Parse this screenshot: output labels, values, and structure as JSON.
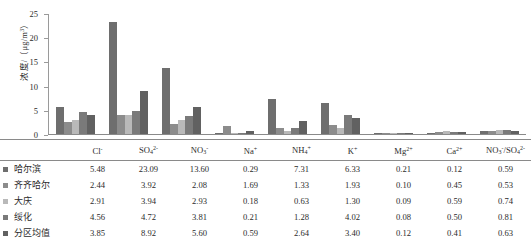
{
  "chart_data": {
    "type": "bar",
    "title": "",
    "xlabel": "",
    "ylabel": "浓度/（μg/m³）",
    "ylim": [
      0,
      25
    ],
    "yticks": [
      0,
      5,
      10,
      15,
      20,
      25
    ],
    "grid": false,
    "legend_position": "table-left",
    "categories": [
      "Cl⁻",
      "SO₄²⁻",
      "NO₃⁻",
      "Na⁺",
      "NH₄⁺",
      "K⁺",
      "Mg²⁺",
      "Ca²⁺",
      "NO₃⁻/SO₄²⁻"
    ],
    "categories_html": [
      "Cl<sup>-</sup>",
      "SO<sub>4</sub><sup>2-</sup>",
      "NO<sub>3</sub><sup>-</sup>",
      "Na<sup>+</sup>",
      "NH<sub>4</sub><sup>+</sup>",
      "K<sup>+</sup>",
      "Mg<sup>2+</sup>",
      "Ca<sup>2+</sup>",
      "NO<sub>3</sub><sup>-</sup>/SO<sub>4</sub><sup>2-</sup>"
    ],
    "series": [
      {
        "name": "哈尔滨",
        "color": "#6e6e6e",
        "values": [
          5.48,
          23.09,
          13.6,
          0.29,
          7.31,
          6.33,
          0.21,
          0.12,
          0.59
        ]
      },
      {
        "name": "齐齐哈尔",
        "color": "#8c8c8c",
        "values": [
          2.44,
          3.92,
          2.08,
          1.69,
          1.33,
          1.93,
          0.1,
          0.45,
          0.53
        ]
      },
      {
        "name": "大庆",
        "color": "#b9b9b9",
        "values": [
          2.91,
          3.94,
          2.93,
          0.18,
          0.63,
          1.3,
          0.09,
          0.59,
          0.74
        ]
      },
      {
        "name": "绥化",
        "color": "#7a7a7a",
        "values": [
          4.56,
          4.72,
          3.81,
          0.21,
          1.28,
          4.02,
          0.08,
          0.5,
          0.81
        ]
      },
      {
        "name": "分区均值",
        "color": "#616161",
        "values": [
          3.85,
          8.92,
          5.6,
          0.59,
          2.64,
          3.4,
          0.12,
          0.41,
          0.63
        ]
      }
    ]
  },
  "table": {
    "corner_label": "",
    "headers": [
      "Cl⁻",
      "SO₄²⁻",
      "NO₃⁻",
      "Na⁺",
      "NH₄⁺",
      "K⁺",
      "Mg²⁺",
      "Ca²⁺",
      "NO₃⁻/SO₄²⁻"
    ],
    "rows": [
      {
        "label": "哈尔滨",
        "values": [
          "5.48",
          "23.09",
          "13.60",
          "0.29",
          "7.31",
          "6.33",
          "0.21",
          "0.12",
          "0.59"
        ]
      },
      {
        "label": "齐齐哈尔",
        "values": [
          "2.44",
          "3.92",
          "2.08",
          "1.69",
          "1.33",
          "1.93",
          "0.10",
          "0.45",
          "0.53"
        ]
      },
      {
        "label": "大庆",
        "values": [
          "2.91",
          "3.94",
          "2.93",
          "0.18",
          "0.63",
          "1.30",
          "0.09",
          "0.59",
          "0.74"
        ]
      },
      {
        "label": "绥化",
        "values": [
          "4.56",
          "4.72",
          "3.81",
          "0.21",
          "1.28",
          "4.02",
          "0.08",
          "0.50",
          "0.81"
        ]
      },
      {
        "label": "分区均值",
        "values": [
          "3.85",
          "8.92",
          "5.60",
          "0.59",
          "2.64",
          "3.40",
          "0.12",
          "0.41",
          "0.63"
        ]
      }
    ]
  }
}
